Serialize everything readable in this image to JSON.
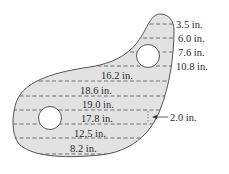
{
  "figure": {
    "colors": {
      "fill": "#e2e2e2",
      "outline": "#555555",
      "dash": "#555555",
      "text": "#2a2a2a",
      "hole": "#ffffff"
    },
    "spacing_label": "2.0 in.",
    "right_labels": [
      {
        "text": "3.5 in."
      },
      {
        "text": "6.0 in."
      },
      {
        "text": "7.6 in."
      },
      {
        "text": "10.8 in."
      }
    ],
    "inner_labels": [
      {
        "text": "16.2 in."
      },
      {
        "text": "18.6 in."
      },
      {
        "text": "19.0 in."
      },
      {
        "text": "17.8 in."
      },
      {
        "text": "12.5 in."
      },
      {
        "text": "8.2 in."
      }
    ]
  }
}
